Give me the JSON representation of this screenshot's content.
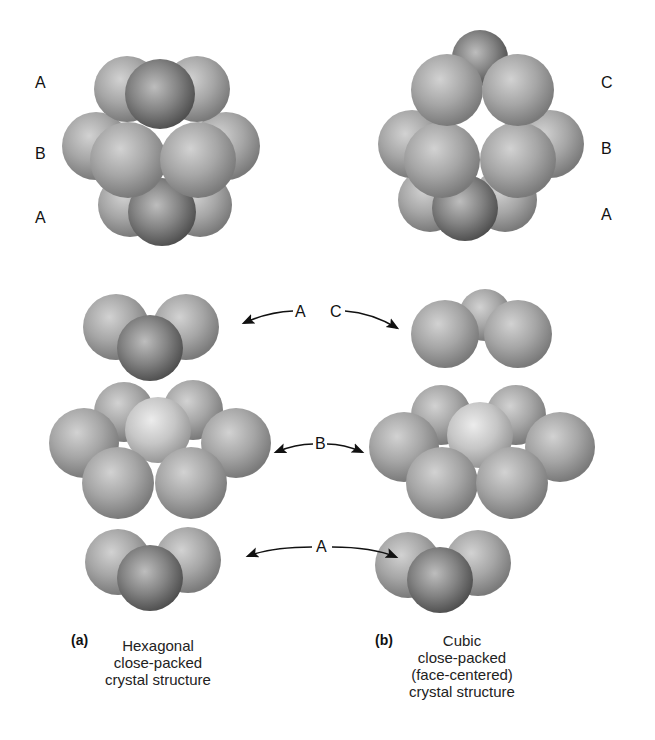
{
  "diagram": {
    "colors": {
      "background": "#ffffff",
      "sphere_mid": "#a8a8a8",
      "sphere_light": "#d6d6d6",
      "sphere_dark": "#6e6e6e",
      "text": "#111111"
    },
    "panel_a": {
      "tag": "(a)",
      "caption_lines": [
        "Hexagonal",
        "close-packed",
        "crystal structure"
      ],
      "stack_layer_labels": [
        "A",
        "B",
        "A"
      ]
    },
    "panel_b": {
      "tag": "(b)",
      "caption_lines": [
        "Cubic",
        "close-packed",
        "(face-centered)",
        "crystal structure"
      ],
      "stack_layer_labels": [
        "C",
        "B",
        "A"
      ]
    },
    "exploded_layers": {
      "top": {
        "left_label": "A",
        "right_label": "C"
      },
      "middle": {
        "label": "B"
      },
      "bottom": {
        "label": "A"
      }
    }
  }
}
